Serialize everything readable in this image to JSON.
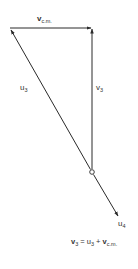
{
  "diagram": {
    "type": "vector-triangle",
    "colors": {
      "line": "#2a2a2a",
      "background": "#ffffff"
    },
    "labels": {
      "vcm": {
        "base": "v",
        "sub": "c.m."
      },
      "u3": {
        "base": "u",
        "sub": "3"
      },
      "v3": {
        "base": "v",
        "sub": "3"
      },
      "u4": {
        "base": "u",
        "sub": "4"
      }
    },
    "equation": {
      "lhs_base": "v",
      "lhs_sub": "3",
      "eq": " = ",
      "term1_base": "u",
      "term1_sub": "3",
      "plus": " + ",
      "term2_base": "v",
      "term2_sub": "c.m."
    },
    "vectors": [
      {
        "name": "v_c.m.",
        "from": [
          10,
          28
        ],
        "to": [
          92,
          28
        ]
      },
      {
        "name": "v_3",
        "from": [
          92,
          172
        ],
        "to": [
          92,
          28
        ]
      },
      {
        "name": "u_3",
        "from": [
          92,
          172
        ],
        "to": [
          10,
          28
        ]
      },
      {
        "name": "u_4",
        "from": [
          92,
          172
        ],
        "to": [
          119,
          217
        ]
      }
    ],
    "origin_point": [
      92,
      172
    ]
  }
}
